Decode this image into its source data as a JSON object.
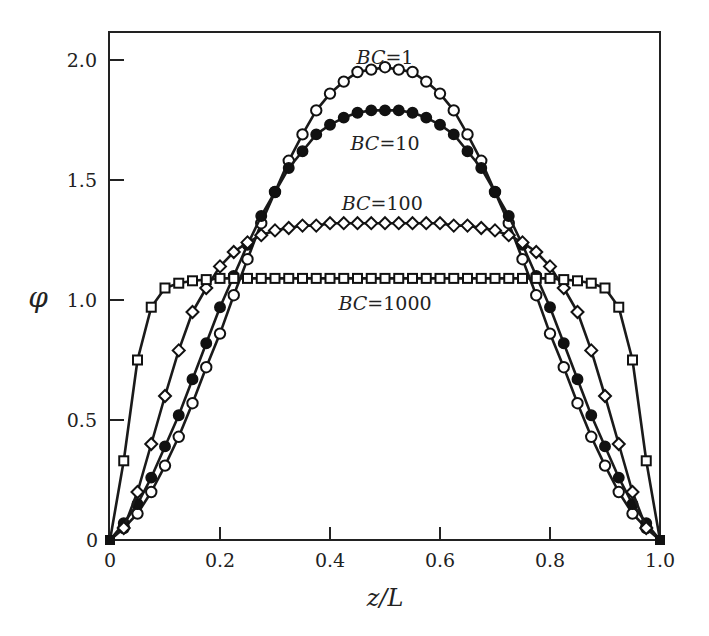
{
  "chart_data": {
    "type": "line",
    "title": "",
    "xlabel": "z/L",
    "ylabel": "φ",
    "xlim": [
      0,
      1.0
    ],
    "ylim": [
      0,
      2.1
    ],
    "xticks": [
      0,
      0.2,
      0.4,
      0.6,
      0.8,
      1.0
    ],
    "xtick_labels": [
      "0",
      "0.2",
      "0.4",
      "0.6",
      "0.8",
      "1.0"
    ],
    "yticks": [
      0,
      0.5,
      1.0,
      1.5,
      2.0
    ],
    "ytick_labels": [
      "0",
      "0.5",
      "1.0",
      "1.5",
      "2.0"
    ],
    "grid": false,
    "legend": "inline annotations",
    "x_step": 0.025,
    "series": [
      {
        "name": "BC=1",
        "label_var": "BC",
        "label_val": "1",
        "marker": "open-circle",
        "label_pos": [
          0.5,
          1.985
        ],
        "half_values": [
          0,
          0.05,
          0.11,
          0.2,
          0.31,
          0.43,
          0.57,
          0.72,
          0.86,
          1.02,
          1.17,
          1.32,
          1.45,
          1.58,
          1.69,
          1.79,
          1.86,
          1.91,
          1.95,
          1.96,
          1.97
        ]
      },
      {
        "name": "BC=10",
        "label_var": "BC",
        "label_val": "10",
        "marker": "filled-circle",
        "label_pos": [
          0.5,
          1.625
        ],
        "half_values": [
          0,
          0.07,
          0.15,
          0.26,
          0.39,
          0.52,
          0.67,
          0.82,
          0.97,
          1.1,
          1.23,
          1.35,
          1.45,
          1.55,
          1.62,
          1.69,
          1.73,
          1.76,
          1.78,
          1.79,
          1.79
        ]
      },
      {
        "name": "BC=100",
        "label_var": "BC",
        "label_val": "100",
        "marker": "open-diamond",
        "label_pos": [
          0.495,
          1.375
        ],
        "half_values": [
          0,
          0.05,
          0.2,
          0.4,
          0.6,
          0.79,
          0.95,
          1.05,
          1.14,
          1.2,
          1.24,
          1.27,
          1.29,
          1.3,
          1.31,
          1.31,
          1.32,
          1.32,
          1.32,
          1.32,
          1.32
        ]
      },
      {
        "name": "BC=1000",
        "label_var": "BC",
        "label_val": "1000",
        "marker": "open-square",
        "label_pos": [
          0.5,
          0.96
        ],
        "half_values": [
          0,
          0.33,
          0.75,
          0.97,
          1.05,
          1.07,
          1.08,
          1.085,
          1.09,
          1.09,
          1.09,
          1.09,
          1.09,
          1.09,
          1.09,
          1.09,
          1.09,
          1.09,
          1.09,
          1.09,
          1.09
        ]
      }
    ]
  }
}
